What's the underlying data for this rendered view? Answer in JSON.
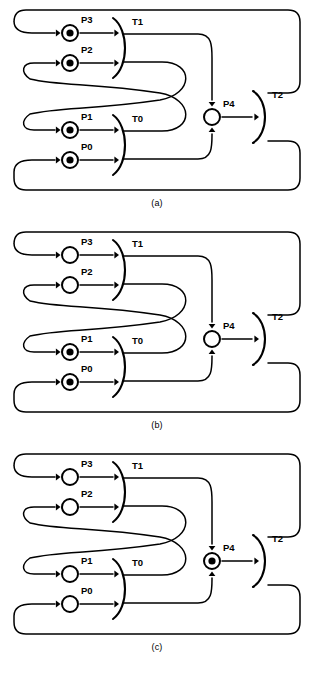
{
  "figure": {
    "width": 314,
    "height": 677,
    "background": "#ffffff",
    "stroke_color": "#000000"
  },
  "panels": [
    {
      "id": "a",
      "caption": "(a)",
      "places": [
        {
          "name": "P3",
          "label": "P3",
          "tokens": 1
        },
        {
          "name": "P2",
          "label": "P2",
          "tokens": 1
        },
        {
          "name": "P1",
          "label": "P1",
          "tokens": 1
        },
        {
          "name": "P0",
          "label": "P0",
          "tokens": 1
        },
        {
          "name": "P4",
          "label": "P4",
          "tokens": 0
        }
      ],
      "transitions": [
        {
          "name": "T1",
          "label": "T1"
        },
        {
          "name": "T0",
          "label": "T0"
        },
        {
          "name": "T2",
          "label": "T2"
        }
      ]
    },
    {
      "id": "b",
      "caption": "(b)",
      "places": [
        {
          "name": "P3",
          "label": "P3",
          "tokens": 0
        },
        {
          "name": "P2",
          "label": "P2",
          "tokens": 0
        },
        {
          "name": "P1",
          "label": "P1",
          "tokens": 1
        },
        {
          "name": "P0",
          "label": "P0",
          "tokens": 1
        },
        {
          "name": "P4",
          "label": "P4",
          "tokens": 0
        }
      ],
      "transitions": [
        {
          "name": "T1",
          "label": "T1"
        },
        {
          "name": "T0",
          "label": "T0"
        },
        {
          "name": "T2",
          "label": "T2"
        }
      ]
    },
    {
      "id": "c",
      "caption": "(c)",
      "places": [
        {
          "name": "P3",
          "label": "P3",
          "tokens": 0
        },
        {
          "name": "P2",
          "label": "P2",
          "tokens": 0
        },
        {
          "name": "P1",
          "label": "P1",
          "tokens": 0
        },
        {
          "name": "P0",
          "label": "P0",
          "tokens": 0
        },
        {
          "name": "P4",
          "label": "P4",
          "tokens": 1
        }
      ],
      "transitions": [
        {
          "name": "T1",
          "label": "T1"
        },
        {
          "name": "T0",
          "label": "T0"
        },
        {
          "name": "T2",
          "label": "T2"
        }
      ]
    }
  ]
}
